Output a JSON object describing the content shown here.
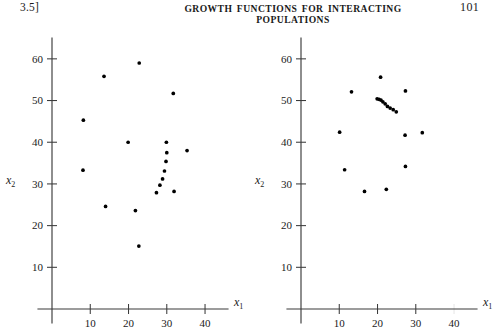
{
  "header": {
    "chapter_marker": "3.5]",
    "title": "GROWTH FUNCTIONS FOR INTERACTING POPULATIONS",
    "page_number": "101"
  },
  "colors": {
    "ink": "#1a1a1a",
    "axis": "#3b3b3b",
    "point": "#000000",
    "background": "#ffffff"
  },
  "chart_data": [
    {
      "id": "left-scatter",
      "type": "scatter",
      "title": "",
      "xlabel": "x1",
      "ylabel": "x2",
      "xlabel_display": "x",
      "xlabel_sub": "1",
      "ylabel_display": "x",
      "ylabel_sub": "2",
      "xlim": [
        0,
        46
      ],
      "ylim": [
        0,
        65
      ],
      "xticks": [
        10,
        20,
        30,
        40
      ],
      "yticks": [
        10,
        20,
        30,
        40,
        50,
        60
      ],
      "xticklabels": [
        "10",
        "20",
        "30",
        "40"
      ],
      "yticklabels": [
        "10",
        "20",
        "30",
        "40",
        "50",
        "60"
      ],
      "grid": false,
      "legend": false,
      "marker": "filled-circle",
      "points": [
        [
          8.2,
          45.3
        ],
        [
          8.1,
          33.3
        ],
        [
          13.6,
          55.8
        ],
        [
          14.0,
          24.6
        ],
        [
          19.9,
          40.0
        ],
        [
          21.8,
          23.6
        ],
        [
          22.8,
          59.0
        ],
        [
          22.7,
          15.1
        ],
        [
          27.3,
          27.9
        ],
        [
          28.2,
          29.7
        ],
        [
          28.9,
          31.2
        ],
        [
          29.4,
          33.1
        ],
        [
          29.8,
          35.4
        ],
        [
          30.0,
          37.5
        ],
        [
          29.9,
          40.0
        ],
        [
          31.7,
          51.7
        ],
        [
          31.9,
          28.2
        ],
        [
          35.3,
          38.0
        ]
      ]
    },
    {
      "id": "right-scatter",
      "type": "scatter",
      "title": "",
      "xlabel": "x1",
      "ylabel": "x2",
      "xlabel_display": "x",
      "xlabel_sub": "1",
      "ylabel_display": "x",
      "ylabel_sub": "2",
      "xlim": [
        0,
        46
      ],
      "ylim": [
        0,
        65
      ],
      "xticks": [
        10,
        20,
        30,
        40
      ],
      "yticks": [
        10,
        20,
        30,
        40,
        50,
        60
      ],
      "xticklabels": [
        "10",
        "20",
        "30",
        "40"
      ],
      "yticklabels": [
        "10",
        "20",
        "30",
        "40",
        "50",
        "60"
      ],
      "grid": false,
      "legend": false,
      "marker": "filled-circle",
      "points": [
        [
          10.1,
          42.4
        ],
        [
          11.4,
          33.4
        ],
        [
          13.2,
          52.1
        ],
        [
          16.6,
          28.2
        ],
        [
          19.9,
          50.4
        ],
        [
          20.4,
          50.3
        ],
        [
          20.9,
          50.1
        ],
        [
          21.4,
          49.7
        ],
        [
          20.8,
          55.6
        ],
        [
          22.0,
          49.2
        ],
        [
          22.3,
          28.7
        ],
        [
          22.6,
          48.6
        ],
        [
          23.3,
          48.2
        ],
        [
          24.1,
          47.8
        ],
        [
          24.9,
          47.3
        ],
        [
          27.3,
          52.3
        ],
        [
          27.2,
          41.7
        ],
        [
          27.3,
          34.2
        ],
        [
          31.7,
          42.3
        ]
      ]
    }
  ]
}
